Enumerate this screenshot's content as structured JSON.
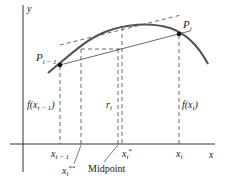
{
  "diagram": {
    "axes": {
      "x_label": "x",
      "y_label": "y"
    },
    "points": {
      "left": {
        "base": "P",
        "sub": "i − 1"
      },
      "right": {
        "base": "P",
        "sub": "i"
      }
    },
    "heights": {
      "left": {
        "prefix": "f(x",
        "sub": "i − 1",
        "suffix": ")"
      },
      "mid": {
        "base": "r",
        "sub": "i"
      },
      "right": {
        "prefix": "f(x",
        "sub": "i",
        "suffix": ")"
      }
    },
    "ticks": {
      "x_left": {
        "base": "x",
        "sub": "i − 1"
      },
      "x_double_star": {
        "base": "x",
        "sub": "i",
        "sup": "**"
      },
      "x_star": {
        "base": "x",
        "sub": "i",
        "sup": "*"
      },
      "x_right": {
        "base": "x",
        "sub": "i"
      }
    },
    "annotation": "Midpoint",
    "colors": {
      "curve": "#555555",
      "lines": "#333333",
      "dashed": "#444444"
    }
  }
}
